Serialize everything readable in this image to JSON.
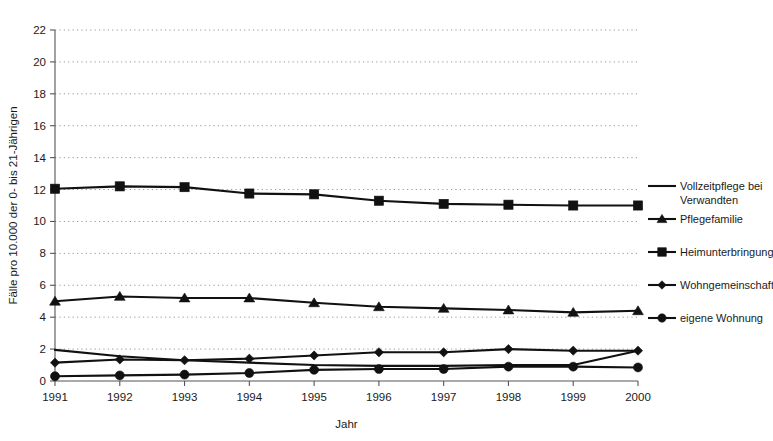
{
  "chart_data": {
    "type": "line",
    "title": "",
    "xlabel": "Jahr",
    "ylabel": "Fälle pro 10.000 der 0- bis 21-Jährigen",
    "categories": [
      "1991",
      "1992",
      "1993",
      "1994",
      "1995",
      "1996",
      "1997",
      "1998",
      "1999",
      "2000"
    ],
    "x": [
      1991,
      1992,
      1993,
      1994,
      1995,
      1996,
      1997,
      1998,
      1999,
      2000
    ],
    "xlim": [
      1991,
      2000
    ],
    "ylim": [
      0,
      22
    ],
    "ytick_step": 2,
    "yticks": [
      "0",
      "2",
      "4",
      "6",
      "8",
      "10",
      "12",
      "14",
      "16",
      "18",
      "20",
      "22"
    ],
    "grid": "horizontal-dotted",
    "legend_position": "right",
    "series": [
      {
        "name": "Vollzeitpflege bei Verwandten",
        "marker": "none",
        "values": [
          1.95,
          1.55,
          1.3,
          1.15,
          1.0,
          0.95,
          0.95,
          1.0,
          1.0,
          1.9
        ]
      },
      {
        "name": "Pflegefamilie",
        "marker": "triangle",
        "values": [
          5.0,
          5.3,
          5.2,
          5.2,
          4.9,
          4.65,
          4.55,
          4.45,
          4.3,
          4.4
        ]
      },
      {
        "name": "Heimunterbringung",
        "marker": "square",
        "values": [
          12.05,
          12.2,
          12.15,
          11.75,
          11.7,
          11.3,
          11.1,
          11.05,
          11.0,
          11.0
        ]
      },
      {
        "name": "Wohngemeinschaft",
        "marker": "diamond",
        "values": [
          1.15,
          1.35,
          1.3,
          1.4,
          1.6,
          1.8,
          1.8,
          2.0,
          1.9,
          1.9
        ]
      },
      {
        "name": "eigene Wohnung",
        "marker": "circle",
        "values": [
          0.3,
          0.35,
          0.4,
          0.5,
          0.7,
          0.75,
          0.75,
          0.9,
          0.9,
          0.85
        ]
      }
    ]
  },
  "legend": {
    "entries": [
      {
        "label_line1": "Vollzeitpflege bei",
        "label_line2": "Verwandten",
        "marker": "none"
      },
      {
        "label_line1": "Pflegefamilie",
        "label_line2": "",
        "marker": "triangle"
      },
      {
        "label_line1": "Heimunterbringung",
        "label_line2": "",
        "marker": "square"
      },
      {
        "label_line1": "Wohngemeinschaft",
        "label_line2": "",
        "marker": "diamond"
      },
      {
        "label_line1": "eigene Wohnung",
        "label_line2": "",
        "marker": "circle"
      }
    ]
  },
  "colors": {
    "ink": "#111111",
    "axis": "#555555",
    "grid": "#8a8a8a",
    "background": "#ffffff"
  }
}
